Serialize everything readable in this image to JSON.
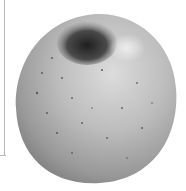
{
  "image": {
    "subject": "apple",
    "description": "Grayscale photo of a speckled apple with stem cavity at top",
    "colors": {
      "background": "#ffffff",
      "apple_light": "#d9d9d9",
      "apple_mid": "#a8a8a8",
      "apple_dark": "#6e6e6e",
      "cavity": "#2a2a2a",
      "frame_line": "#b8b8b8"
    }
  }
}
